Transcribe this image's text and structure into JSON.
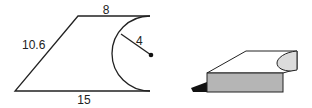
{
  "figure_2d": {
    "top_length": "8",
    "slant_length": "10.6",
    "bottom_length": "15",
    "radius": "4"
  },
  "colors": {
    "stroke": "#222222",
    "front_face": "#b5b5b5",
    "curved_face": "#dcdcdc",
    "shadow": "#111111"
  }
}
